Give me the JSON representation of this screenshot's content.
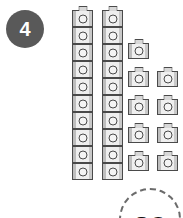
{
  "page": {
    "background_color": "#ffffff"
  },
  "question_badge": {
    "number": "4",
    "background_color": "#595959",
    "text_color": "#ffffff"
  },
  "manipulatives": {
    "icon_name": "unit-cube-icon",
    "cube_fill_color": "#e2e2e2",
    "cube_outline_color": "#4a4a4a",
    "stacks": [
      {
        "name": "stack-of-ten-1",
        "count": 10
      },
      {
        "name": "stack-of-ten-2",
        "count": 10
      }
    ],
    "single_cubes": {
      "count": 9,
      "rows": [
        1,
        2,
        2,
        2,
        2
      ]
    },
    "total_count": 29
  },
  "answer_bubble": {
    "value": "29",
    "border_color": "#6b6b6b",
    "border_style": "dashed"
  },
  "chart_data": {
    "type": "bar",
    "categories": [
      "Stack 1 (tens)",
      "Stack 2 (tens)",
      "Single cubes (ones)"
    ],
    "values": [
      10,
      10,
      9
    ],
    "xlabel": "",
    "ylabel": "Number of unit cubes",
    "ylim": [
      0,
      10
    ],
    "annotations": [
      "Total = 29"
    ],
    "grid": false,
    "legend": "none"
  }
}
